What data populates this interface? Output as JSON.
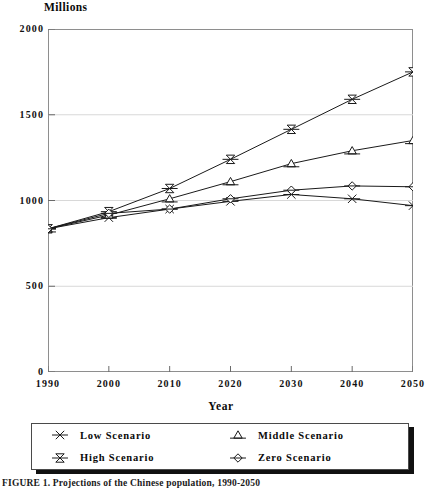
{
  "figure": {
    "y_unit_title": "Millions",
    "x_axis_title": "Year",
    "caption": "FIGURE 1.  Projections of the Chinese population, 1990-2050"
  },
  "legend": {
    "items": [
      {
        "label": "Low Scenario",
        "marker": "asterisk-marker-icon"
      },
      {
        "label": "Middle Scenario",
        "marker": "triangle-marker-icon"
      },
      {
        "label": "High Scenario",
        "marker": "bowtie-marker-icon"
      },
      {
        "label": "Zero Scenario",
        "marker": "diamond-marker-icon"
      }
    ]
  },
  "chart_data": {
    "type": "line",
    "title": "",
    "subtitle": "",
    "xlabel": "Year",
    "ylabel": "Millions",
    "x": [
      1990,
      2000,
      2010,
      2020,
      2030,
      2040,
      2050
    ],
    "xlim": [
      1990,
      2050
    ],
    "ylim": [
      0,
      2000
    ],
    "xticks": [
      "1990",
      "2000",
      "2010",
      "2020",
      "2030",
      "2040",
      "2050"
    ],
    "yticks": [
      "0",
      "500",
      "1000",
      "1500",
      "2000"
    ],
    "ytick_values": [
      0,
      500,
      1000,
      1500,
      2000
    ],
    "grid": true,
    "legend_position": "below-plot",
    "series": [
      {
        "name": "Low Scenario",
        "marker": "asterisk",
        "values": [
          835,
          900,
          950,
          995,
          1035,
          1010,
          970
        ]
      },
      {
        "name": "High Scenario",
        "marker": "bowtie",
        "values": [
          835,
          935,
          1070,
          1240,
          1415,
          1590,
          1750
        ]
      },
      {
        "name": "Middle Scenario",
        "marker": "triangle",
        "values": [
          835,
          915,
          1010,
          1110,
          1215,
          1290,
          1350
        ]
      },
      {
        "name": "Zero Scenario",
        "marker": "diamond",
        "values": [
          835,
          925,
          950,
          1010,
          1060,
          1085,
          1080
        ]
      }
    ]
  }
}
